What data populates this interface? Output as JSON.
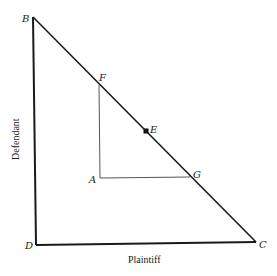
{
  "diagram": {
    "points": {
      "B": {
        "label": "B",
        "x": 33,
        "y": 17
      },
      "D": {
        "label": "D",
        "x": 36,
        "y": 245
      },
      "C": {
        "label": "C",
        "x": 256,
        "y": 242
      },
      "F": {
        "label": "F",
        "x": 99,
        "y": 85
      },
      "A": {
        "label": "A",
        "x": 100,
        "y": 178
      },
      "G": {
        "label": "G",
        "x": 190,
        "y": 177
      },
      "E": {
        "label": "E",
        "x": 146,
        "y": 131
      }
    },
    "x_axis_label": "Plaintiff",
    "y_axis_label": "Defendant",
    "colors": {
      "main_line": "#1a1a1a",
      "inner_line": "#555555"
    }
  }
}
